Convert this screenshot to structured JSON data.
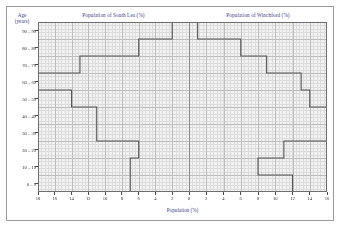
{
  "figure": {
    "y_axis_title_line1": "Age",
    "y_axis_title_line2": "(years)",
    "x_axis_title": "Population (%)",
    "left_panel_title": "Population of South Lea (%)",
    "right_panel_title": "Population of Winchford (%)",
    "title_color": "#3b3b8c",
    "step_color": "#555555",
    "grid_color": "#c9c9c9",
    "plot_background": "#f2f2f2"
  },
  "chart_data": {
    "type": "bar",
    "orientation": "horizontal",
    "layout": "population-pyramid",
    "xlabel": "Population (%)",
    "ylabel": "Age (years)",
    "categories": [
      "0 – 9",
      "10 – 19",
      "20 – 29",
      "30 – 39",
      "40 – 49",
      "50 – 59",
      "60 – 69",
      "70 – 79",
      "80 – 89",
      "90 – 99"
    ],
    "series": [
      {
        "name": "Population of South Lea (%)",
        "side": "left",
        "values": [
          7,
          7,
          6,
          11,
          11,
          14,
          18,
          13,
          6,
          2
        ],
        "axis_max": 18,
        "tick_labels": [
          "18",
          "16",
          "14",
          "12",
          "10",
          "8",
          "6",
          "4",
          "2",
          "0"
        ],
        "tick_values": [
          18,
          16,
          14,
          12,
          10,
          8,
          6,
          4,
          2,
          0
        ]
      },
      {
        "name": "Population of Winchford (%)",
        "side": "right",
        "values": [
          12,
          8,
          11,
          16,
          16,
          14,
          13,
          9,
          6,
          1
        ],
        "axis_max": 16,
        "tick_labels": [
          "0",
          "2",
          "4",
          "6",
          "8",
          "10",
          "12",
          "14",
          "16"
        ],
        "tick_values": [
          0,
          2,
          4,
          6,
          8,
          10,
          12,
          14,
          16
        ]
      }
    ],
    "xlim_left": [
      18,
      0
    ],
    "xlim_right": [
      0,
      16
    ],
    "ylim": [
      0,
      10
    ],
    "grid": true,
    "grid_minor": true,
    "legend": "none",
    "annotations": []
  }
}
